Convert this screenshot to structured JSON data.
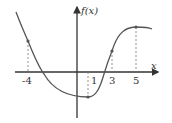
{
  "graph": {
    "y_axis_label": "f(x)",
    "x_axis_label": "x",
    "ticks": [
      {
        "label": "-4",
        "x": 28
      },
      {
        "label": "1",
        "x": 88
      },
      {
        "label": "3",
        "x": 112
      },
      {
        "label": "5",
        "x": 136
      }
    ],
    "marked_points": [
      {
        "x_value": -4,
        "px": 28,
        "py": 41
      },
      {
        "x_value": 1,
        "px": 88,
        "py": 97
      },
      {
        "x_value": 3,
        "px": 112,
        "py": 51
      },
      {
        "x_value": 5,
        "px": 136,
        "py": 27
      }
    ],
    "colors": {
      "curve": "#555555",
      "axis": "#333333",
      "dashed": "#777777"
    }
  }
}
